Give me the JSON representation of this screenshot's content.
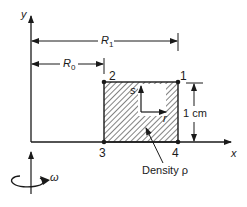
{
  "figure": {
    "axes": {
      "x_label": "x",
      "y_label": "y"
    },
    "dimensions": {
      "r1_label": "R",
      "r1_sub": "1",
      "r0_label": "R",
      "r0_sub": "0",
      "height_label": "1 cm"
    },
    "nodes": [
      {
        "id": "1",
        "label": "1"
      },
      {
        "id": "2",
        "label": "2"
      },
      {
        "id": "3",
        "label": "3"
      },
      {
        "id": "4",
        "label": "4"
      }
    ],
    "local_axes": {
      "s_label": "s",
      "r_label": "r"
    },
    "annotation": {
      "density_label": "Density ρ"
    },
    "rotation": {
      "omega_label": "ω"
    },
    "colors": {
      "ink": "#1a1a1a",
      "background": "#ffffff"
    }
  }
}
